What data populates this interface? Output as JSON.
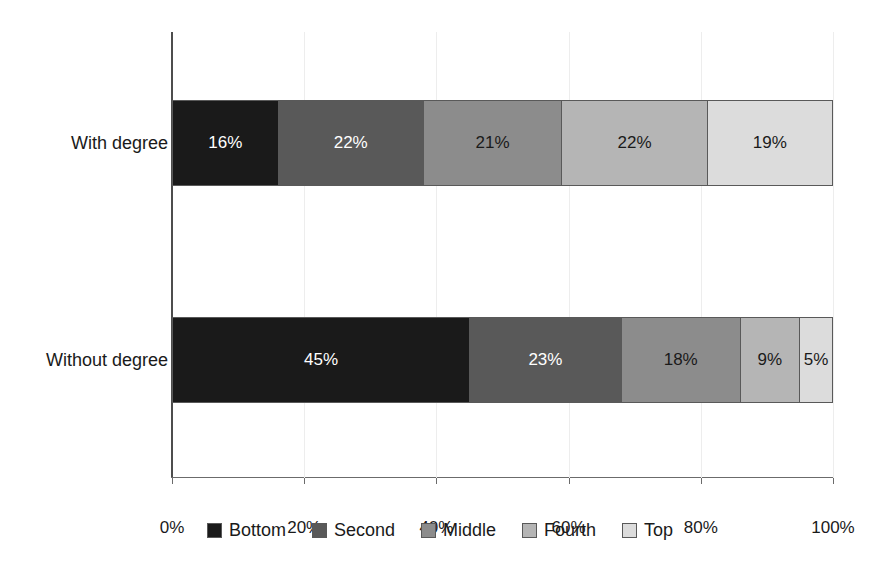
{
  "chart_data": {
    "type": "bar",
    "subtype": "stacked-horizontal-100-percent",
    "title": "",
    "xlabel": "",
    "ylabel": "",
    "categories": [
      "With degree",
      "Without degree"
    ],
    "series": [
      {
        "name": "Bottom",
        "color": "#1a1a1a",
        "label_color": "#ffffff",
        "values": [
          16,
          45
        ],
        "labels": [
          "16%",
          "45%"
        ]
      },
      {
        "name": "Second",
        "color": "#595959",
        "label_color": "#ffffff",
        "values": [
          22,
          23
        ],
        "labels": [
          "22%",
          "23%"
        ]
      },
      {
        "name": "Middle",
        "color": "#8c8c8c",
        "label_color": "#1a1a1a",
        "values": [
          21,
          18
        ],
        "labels": [
          "21%",
          "18%"
        ]
      },
      {
        "name": "Fourth",
        "color": "#b5b5b5",
        "label_color": "#1a1a1a",
        "values": [
          22,
          9
        ],
        "labels": [
          "22%",
          "9%"
        ]
      },
      {
        "name": "Top",
        "color": "#dcdcdc",
        "label_color": "#1a1a1a",
        "values": [
          19,
          5
        ],
        "labels": [
          "19%",
          "5%"
        ]
      }
    ],
    "xlim": [
      0,
      100
    ],
    "xticks": [
      0,
      20,
      40,
      60,
      80,
      100
    ],
    "xtick_labels": [
      "0%",
      "20%",
      "40%",
      "60%",
      "80%",
      "100%"
    ],
    "grid": true,
    "grid_axis": "x",
    "legend_position": "bottom",
    "legend_entries": [
      "Bottom",
      "Second",
      "Middle",
      "Fourth",
      "Top"
    ]
  },
  "axis": {
    "ticks": [
      {
        "value": 0,
        "label": "0%"
      },
      {
        "value": 20,
        "label": "20%"
      },
      {
        "value": 40,
        "label": "40%"
      },
      {
        "value": 60,
        "label": "60%"
      },
      {
        "value": 80,
        "label": "80%"
      },
      {
        "value": 100,
        "label": "100%"
      }
    ]
  }
}
